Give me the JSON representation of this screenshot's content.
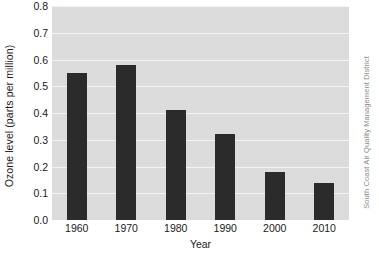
{
  "chart_data": {
    "type": "bar",
    "title": "",
    "xlabel": "Year",
    "ylabel": "Ozone level (parts per million)",
    "categories": [
      "1960",
      "1970",
      "1980",
      "1990",
      "2000",
      "2010"
    ],
    "values": [
      0.55,
      0.58,
      0.41,
      0.32,
      0.18,
      0.14
    ],
    "ylim": [
      0.0,
      0.8
    ],
    "ytick_labels": [
      "0.0",
      "0.1",
      "0.2",
      "0.3",
      "0.4",
      "0.5",
      "0.6",
      "0.7",
      "0.8"
    ],
    "ytick_values": [
      0.0,
      0.1,
      0.2,
      0.3,
      0.4,
      0.5,
      0.6,
      0.7,
      0.8
    ],
    "grid": true,
    "legend": false,
    "legend_position": "none",
    "bar_color": "#2b2b2b",
    "plot_background": "#dcdcdc",
    "gridline_color": "#f4f4f4",
    "figure_background": "#ffffff"
  },
  "credit": {
    "text": "South Coast Air Quality Management District",
    "color": "#8d8d8d"
  }
}
